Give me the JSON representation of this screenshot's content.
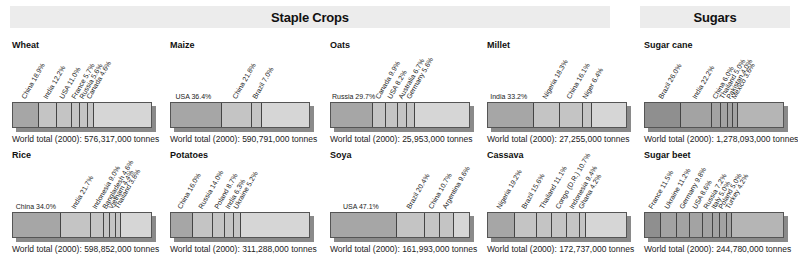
{
  "banners": {
    "staple": "Staple Crops",
    "sugars": "Sugars"
  },
  "colors": {
    "staple_main": "#a6a6a6",
    "staple_light": "#c4c4c4",
    "staple_rest": "#d6d6d6",
    "sugar_main": "#8f8f8f",
    "sugar_light": "#a3a3a3",
    "sugar_rest": "#b5b5b5",
    "banner_bg": "#ececec",
    "divider": "#444444"
  },
  "chart_data": [
    {
      "type": "bar",
      "title": "Wheat",
      "group": "staple",
      "total": "World total (2000): 576,317,000 tonnes",
      "categories": [
        "China",
        "India",
        "USA",
        "France",
        "Russia",
        "Canada"
      ],
      "values": [
        18.9,
        12.2,
        11.0,
        5.7,
        5.6,
        4.6
      ],
      "labels": [
        "China 18.9%",
        "India 12.2%",
        "USA 11.0%",
        "France 5.7%",
        "Russia 5.6%",
        "Canada 4.6%"
      ],
      "flat_first": false
    },
    {
      "type": "bar",
      "title": "Maize",
      "group": "staple",
      "total": "World total (2000): 590,791,000 tonnes",
      "categories": [
        "USA",
        "China",
        "Brazil"
      ],
      "values": [
        36.4,
        21.8,
        7.0
      ],
      "labels": [
        "USA 36.4%",
        "China 21.8%",
        "Brazil 7.0%"
      ],
      "flat_first": true
    },
    {
      "type": "bar",
      "title": "Oats",
      "group": "staple",
      "total": "World total (2000): 25,953,000 tonnes",
      "categories": [
        "Russia",
        "Canada",
        "USA",
        "Australia",
        "Germany"
      ],
      "values": [
        29.7,
        9.9,
        8.2,
        6.7,
        5.6
      ],
      "labels": [
        "Russia 29.7%",
        "Canada 9.9%",
        "USA 8.2%",
        "Australia 6.7%",
        "Germany 5.6%"
      ],
      "flat_first": true
    },
    {
      "type": "bar",
      "title": "Millet",
      "group": "staple",
      "total": "World total (2000): 27,255,000 tonnes",
      "categories": [
        "India",
        "Nigeria",
        "China",
        "Niger"
      ],
      "values": [
        33.2,
        18.3,
        16.1,
        6.4
      ],
      "labels": [
        "India 33.2%",
        "Nigeria 18.3%",
        "China 16.1%",
        "Niger 6.4%"
      ],
      "flat_first": true
    },
    {
      "type": "bar",
      "title": "Sugar cane",
      "group": "sugar",
      "total": "World total (2000): 1,278,093,000 tonnes",
      "categories": [
        "Brazil",
        "India",
        "China",
        "Thailand",
        "Pakistan",
        "Mexico"
      ],
      "values": [
        26.0,
        22.2,
        6.0,
        5.0,
        4.0,
        3.6
      ],
      "labels": [
        "Brazil 26.0%",
        "India 22.2%",
        "China 6.0%",
        "Thailand 5.0%",
        "Pakistan 4.0%",
        "Mexico 3.6%"
      ],
      "flat_first": false
    },
    {
      "type": "bar",
      "title": "Rice",
      "group": "staple",
      "total": "World total (2000): 598,852,000 tonnes",
      "categories": [
        "China",
        "India",
        "Indonesia",
        "Bangladesh",
        "Vietnam",
        "Thailand"
      ],
      "values": [
        34.0,
        21.7,
        9.0,
        4.6,
        4.4,
        3.8
      ],
      "labels": [
        "China 34.0%",
        "India 21.7%",
        "Indonesia 9.0%",
        "Bangladesh 4.6%",
        "Vietnam 4.4%",
        "Thailand 3.8%"
      ],
      "flat_first": true
    },
    {
      "type": "bar",
      "title": "Potatoes",
      "group": "staple",
      "total": "World total (2000): 311,288,000 tonnes",
      "categories": [
        "China",
        "Russia",
        "Poland",
        "India",
        "Ukraine"
      ],
      "values": [
        16.0,
        14.0,
        8.7,
        6.3,
        5.2
      ],
      "labels": [
        "China 16.0%",
        "Russia 14.0%",
        "Poland 8.7%",
        "India 6.3%",
        "Ukraine 5.2%"
      ],
      "flat_first": false
    },
    {
      "type": "bar",
      "title": "Soya",
      "group": "staple",
      "total": "World total (2000): 161,993,000 tonnes",
      "categories": [
        "USA",
        "Brazil",
        "China",
        "Argentina"
      ],
      "values": [
        47.1,
        20.4,
        10.7,
        9.6
      ],
      "labels": [
        "USA 47.1%",
        "Brazil 20.4%",
        "China 10.7%",
        "Argentina 9.6%"
      ],
      "flat_first": true
    },
    {
      "type": "bar",
      "title": "Cassava",
      "group": "staple",
      "total": "World total (2000): 172,737,000 tonnes",
      "categories": [
        "Nigeria",
        "Brazil",
        "Thailand",
        "Congo (D.R.)",
        "Indonesia",
        "Ghana"
      ],
      "values": [
        19.2,
        15.6,
        11.1,
        10.7,
        9.4,
        4.2
      ],
      "labels": [
        "Nigeria 19.2%",
        "Brazil 15.6%",
        "Thailand 11.1%",
        "Congo (D.R.) 10.7%",
        "Indonesia 9.4%",
        "Ghana 4.2%"
      ],
      "flat_first": false
    },
    {
      "type": "bar",
      "title": "Sugar beet",
      "group": "sugar",
      "total": "World total (2000): 244,780,000 tonnes",
      "categories": [
        "France",
        "Ukraine",
        "Germany",
        "USA",
        "Russia",
        "Italy",
        "Poland",
        "Turkey"
      ],
      "values": [
        11.5,
        11.2,
        9.8,
        8.6,
        7.2,
        5.0,
        5.0,
        4.2
      ],
      "labels": [
        "France 11.5%",
        "Ukraine 11.2%",
        "Germany 9.8%",
        "USA 8.6%",
        "Russia 7.2%",
        "Italy 5.0%",
        "Poland 5.0%",
        "Turkey 4.2%"
      ],
      "flat_first": false
    }
  ]
}
